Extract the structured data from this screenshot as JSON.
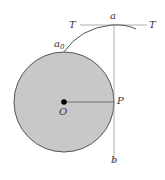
{
  "labels": {
    "T_left": "T",
    "T_right": "T",
    "a": "a",
    "a0": "a",
    "a0_sub": "0",
    "P": "P",
    "O": "O",
    "b": "b"
  },
  "colors": {
    "circle_fill": "#c8c8c8",
    "circle_stroke": "#555555",
    "line": "#888888",
    "curve": "#555555",
    "center_dot": "#000000"
  }
}
